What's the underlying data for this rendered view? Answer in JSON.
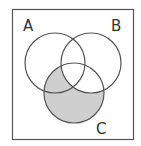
{
  "diagram": {
    "type": "venn",
    "sets": [
      {
        "id": "A",
        "label": "A"
      },
      {
        "id": "B",
        "label": "B"
      },
      {
        "id": "C",
        "label": "C"
      }
    ],
    "shaded_region": "C minus B",
    "colors": {
      "background": "#ffffff",
      "stroke": "#555555",
      "shade": "#cfcfcf",
      "frame": "#555555"
    }
  }
}
